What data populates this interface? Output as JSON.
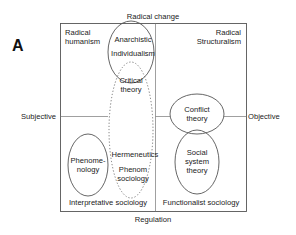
{
  "panel_label": "A",
  "axes": {
    "top": "Radical change",
    "bottom": "Regulation",
    "left": "Subjective",
    "right": "Objective"
  },
  "quadrants": {
    "top_left": [
      "Radical",
      "humanism"
    ],
    "top_right": [
      "Radical",
      "Structuralism"
    ],
    "bottom_left": "Interpretative sociology",
    "bottom_right": "Functionalist sociology"
  },
  "theories": {
    "anarchistic_individualism": [
      "Anarchistic",
      "Individualism"
    ],
    "critical_theory": [
      "Critical",
      "theory"
    ],
    "conflict_theory": [
      "Conflict",
      "theory"
    ],
    "hermeneutics": "Hermeneutics",
    "phenomenology": [
      "Phenome-",
      "nology"
    ],
    "phenomenological_sociology": [
      "Phenom",
      "sociology"
    ],
    "social_system_theory": [
      "Social",
      "system",
      "theory"
    ]
  },
  "colors": {
    "line": "#555555",
    "text": "#222222",
    "background": "#ffffff"
  }
}
